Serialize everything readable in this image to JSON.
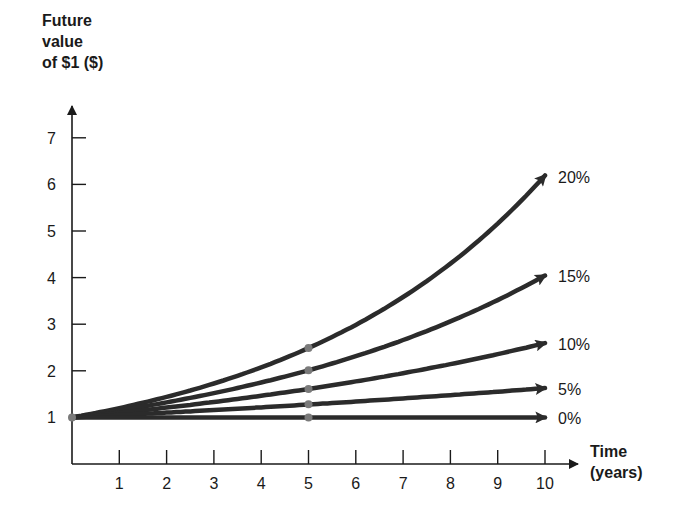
{
  "chart_data": {
    "type": "line",
    "title": "",
    "ylabel_lines": [
      "Future",
      "value",
      "of $1 ($)"
    ],
    "xlabel_lines": [
      "Time",
      "(years)"
    ],
    "xlabel": "Time (years)",
    "ylabel": "Future value of $1 ($)",
    "xlim": [
      0,
      10
    ],
    "ylim": [
      0,
      7
    ],
    "x_ticks": [
      1,
      2,
      3,
      4,
      5,
      6,
      7,
      8,
      9,
      10
    ],
    "y_ticks": [
      1,
      2,
      3,
      4,
      5,
      6,
      7
    ],
    "grid": false,
    "legend_position": "inline-right",
    "x": [
      0,
      1,
      2,
      3,
      4,
      5,
      6,
      7,
      8,
      9,
      10
    ],
    "series": [
      {
        "name": "20%",
        "rate": 0.2,
        "values": [
          1.0,
          1.2,
          1.44,
          1.73,
          2.07,
          2.49,
          2.99,
          3.58,
          4.3,
          5.16,
          6.19
        ]
      },
      {
        "name": "15%",
        "rate": 0.15,
        "values": [
          1.0,
          1.15,
          1.32,
          1.52,
          1.75,
          2.01,
          2.31,
          2.66,
          3.06,
          3.52,
          4.05
        ]
      },
      {
        "name": "10%",
        "rate": 0.1,
        "values": [
          1.0,
          1.1,
          1.21,
          1.33,
          1.46,
          1.61,
          1.77,
          1.95,
          2.14,
          2.36,
          2.59
        ]
      },
      {
        "name": "5%",
        "rate": 0.05,
        "values": [
          1.0,
          1.05,
          1.1,
          1.16,
          1.22,
          1.28,
          1.34,
          1.41,
          1.48,
          1.55,
          1.63
        ]
      },
      {
        "name": "0%",
        "rate": 0.0,
        "values": [
          1.0,
          1.0,
          1.0,
          1.0,
          1.0,
          1.0,
          1.0,
          1.0,
          1.0,
          1.0,
          1.0
        ]
      }
    ],
    "markers": [
      {
        "x": 0,
        "y": 1.0
      },
      {
        "x": 5,
        "y": 2.49
      },
      {
        "x": 5,
        "y": 2.01
      },
      {
        "x": 5,
        "y": 1.61
      },
      {
        "x": 5,
        "y": 1.28
      },
      {
        "x": 5,
        "y": 1.0
      }
    ]
  },
  "style": {
    "line_color": "#2b2b2b",
    "marker_color": "#7a7a7a",
    "axis_color": "#1a1a1a"
  }
}
